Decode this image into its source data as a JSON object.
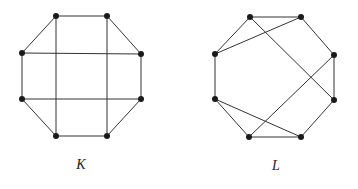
{
  "graphs": [
    {
      "name": "K",
      "label": "K",
      "label_pos": [
        81,
        165
      ],
      "vertices": [
        {
          "id": "k1",
          "x": 56,
          "y": 16
        },
        {
          "id": "k2",
          "x": 107,
          "y": 16
        },
        {
          "id": "k3",
          "x": 141,
          "y": 54
        },
        {
          "id": "k4",
          "x": 141,
          "y": 99
        },
        {
          "id": "k5",
          "x": 107,
          "y": 136
        },
        {
          "id": "k6",
          "x": 56,
          "y": 136
        },
        {
          "id": "k7",
          "x": 22,
          "y": 99
        },
        {
          "id": "k8",
          "x": 22,
          "y": 53
        }
      ],
      "edges": [
        [
          "k1",
          "k2"
        ],
        [
          "k2",
          "k3"
        ],
        [
          "k3",
          "k4"
        ],
        [
          "k4",
          "k5"
        ],
        [
          "k5",
          "k6"
        ],
        [
          "k6",
          "k7"
        ],
        [
          "k7",
          "k8"
        ],
        [
          "k8",
          "k1"
        ],
        [
          "k1",
          "k6"
        ],
        [
          "k2",
          "k5"
        ],
        [
          "k8",
          "k3"
        ],
        [
          "k7",
          "k4"
        ]
      ]
    },
    {
      "name": "L",
      "label": "L",
      "label_pos": [
        276,
        166
      ],
      "vertices": [
        {
          "id": "l1",
          "x": 250,
          "y": 17
        },
        {
          "id": "l2",
          "x": 301,
          "y": 17
        },
        {
          "id": "l3",
          "x": 334,
          "y": 55
        },
        {
          "id": "l4",
          "x": 334,
          "y": 100
        },
        {
          "id": "l5",
          "x": 301,
          "y": 137
        },
        {
          "id": "l6",
          "x": 249,
          "y": 137
        },
        {
          "id": "l7",
          "x": 215,
          "y": 99
        },
        {
          "id": "l8",
          "x": 215,
          "y": 54
        }
      ],
      "edges": [
        [
          "l1",
          "l2"
        ],
        [
          "l2",
          "l3"
        ],
        [
          "l3",
          "l4"
        ],
        [
          "l4",
          "l5"
        ],
        [
          "l5",
          "l6"
        ],
        [
          "l6",
          "l7"
        ],
        [
          "l7",
          "l8"
        ],
        [
          "l8",
          "l1"
        ],
        [
          "l8",
          "l2"
        ],
        [
          "l1",
          "l4"
        ],
        [
          "l3",
          "l6"
        ],
        [
          "l7",
          "l5"
        ]
      ]
    }
  ],
  "style": {
    "edge_color": "#333333",
    "vertex_color": "#1a1a1a",
    "vertex_radius": 3
  }
}
